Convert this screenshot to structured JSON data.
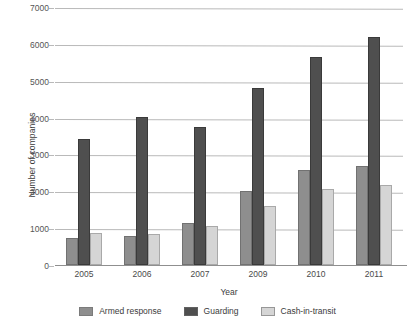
{
  "chart_data": {
    "type": "bar",
    "title": "",
    "xlabel": "Year",
    "ylabel": "Number of companies",
    "categories": [
      "2005",
      "2006",
      "2007",
      "2009",
      "2010",
      "2011"
    ],
    "series": [
      {
        "name": "Armed response",
        "color": "#8e8e8e",
        "values": [
          720,
          780,
          1150,
          2020,
          2590,
          2700
        ]
      },
      {
        "name": "Guarding",
        "color": "#4f4f4f",
        "values": [
          3420,
          4010,
          3750,
          4790,
          5640,
          6200
        ]
      },
      {
        "name": "Cash-in-transit",
        "color": "#d5d5d5",
        "values": [
          870,
          840,
          1050,
          1610,
          2060,
          2160
        ]
      }
    ],
    "ylim": [
      0,
      7000
    ],
    "ytick_step": 1000,
    "yticks": [
      "0",
      "1000",
      "2000",
      "3000",
      "4000",
      "5000",
      "6000",
      "7000"
    ],
    "grid": true,
    "grid_axis": "y",
    "legend_position": "bottom"
  }
}
